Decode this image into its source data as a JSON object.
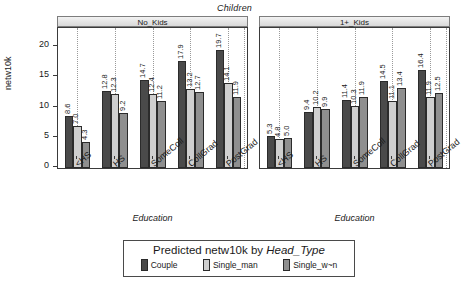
{
  "chart_data": {
    "type": "bar",
    "title": "",
    "outer_strip_label": "Children",
    "xlabel": "Education",
    "ylabel": "netw10k",
    "ylim": [
      0,
      23
    ],
    "yticks": [
      0,
      5,
      10,
      15,
      20
    ],
    "ytick_labels": [
      "0",
      "5",
      "10",
      "15",
      "20"
    ],
    "grid": "vertical-dotted",
    "legend": {
      "position": "bottom",
      "title_plain": "Predicted netw10k by ",
      "title_italic": "Head_Type",
      "entries": [
        {
          "name": "Couple",
          "color": "#4a4a4a"
        },
        {
          "name": "Single_man",
          "color": "#cfcfcf"
        },
        {
          "name": "Single_w~n",
          "color": "#8f8f8f"
        }
      ]
    },
    "categories": [
      "<HS",
      "HS",
      "SomeColl",
      "CollGrad",
      "PostGrad"
    ],
    "panels": [
      {
        "strip_label": "No_Kids",
        "xlabel": "Education",
        "series": [
          {
            "name": "Couple",
            "values": [
              8.6,
              12.8,
              14.7,
              17.9,
              19.7
            ]
          },
          {
            "name": "Single_man",
            "values": [
              7.0,
              12.3,
              12.4,
              13.2,
              14.1
            ]
          },
          {
            "name": "Single_w~n",
            "values": [
              4.3,
              9.2,
              11.2,
              12.7,
              11.9
            ]
          }
        ]
      },
      {
        "strip_label": "1+_Kids",
        "xlabel": "Education",
        "series": [
          {
            "name": "Couple",
            "values": [
              5.3,
              9.4,
              11.4,
              14.5,
              16.4
            ]
          },
          {
            "name": "Single_man",
            "values": [
              4.8,
              10.2,
              10.3,
              11.1,
              11.9
            ]
          },
          {
            "name": "Single_w~n",
            "values": [
              5.0,
              9.9,
              11.9,
              13.4,
              12.5
            ]
          }
        ]
      }
    ],
    "bar_labels": [
      [
        "8.6",
        "7.0",
        "4.3",
        "12.8",
        "12.3",
        "9.2",
        "14.7",
        "12.4",
        "11.2",
        "17.9",
        "13.2",
        "12.7",
        "19.7",
        "14.1",
        "11.9"
      ],
      [
        "5.3",
        "4.8",
        "5.0",
        "9.4",
        "10.2",
        "9.9",
        "11.4",
        "10.3",
        "11.9",
        "14.5",
        "11.1",
        "13.4",
        "16.4",
        "11.9",
        "12.5"
      ]
    ]
  }
}
